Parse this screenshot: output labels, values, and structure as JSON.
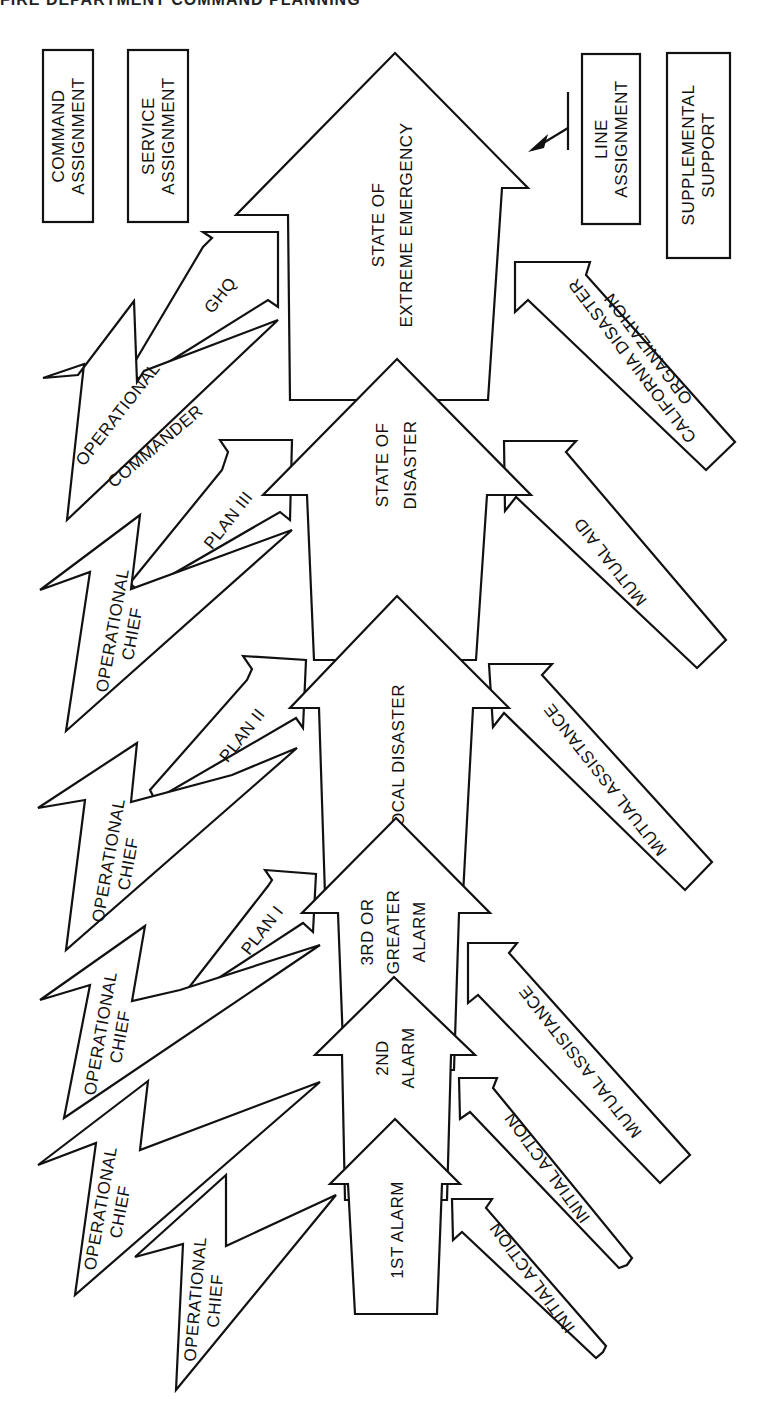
{
  "header": {
    "text": "FIRE DEPARTMENT COMMAND PLANNING"
  },
  "legend": {
    "command": {
      "line1": "COMMAND",
      "line2": "ASSIGNMENT"
    },
    "service": {
      "line1": "SERVICE",
      "line2": "ASSIGNMENT"
    },
    "line": {
      "line1": "LINE",
      "line2": "ASSIGNMENT"
    },
    "supplemental": {
      "line1": "SUPPLEMENTAL",
      "line2": "SUPPORT"
    }
  },
  "levels": [
    {
      "line1": "1ST ALARM",
      "line2": ""
    },
    {
      "line1": "2ND",
      "line2": "ALARM"
    },
    {
      "line1": "3RD OR",
      "line2": "GREATER",
      "line3": "ALARM"
    },
    {
      "line1": "LOCAL DISASTER",
      "line2": ""
    },
    {
      "line1": "STATE OF",
      "line2": "DISASTER"
    },
    {
      "line1": "STATE OF",
      "line2": "EXTREME EMERGENCY"
    }
  ],
  "command_bolts": [
    {
      "line1": "OPERATIONAL",
      "line2": "CHIEF"
    },
    {
      "line1": "OPERATIONAL",
      "line2": "CHIEF"
    },
    {
      "line1": "OPERATIONAL",
      "line2": "CHIEF"
    },
    {
      "line1": "OPERATIONAL",
      "line2": "CHIEF"
    },
    {
      "line1": "OPERATIONAL",
      "line2": "CHIEF"
    },
    {
      "line1": "OPERATIONAL",
      "line2": "COMMANDER"
    }
  ],
  "service_arrows": [
    {
      "label": "PLAN I"
    },
    {
      "label": "PLAN II"
    },
    {
      "label": "PLAN III"
    },
    {
      "label": "GHQ"
    }
  ],
  "support_arrows": [
    {
      "line1": "INITIAL ACTION",
      "line2": ""
    },
    {
      "line1": "INITIAL ACTION",
      "line2": ""
    },
    {
      "line1": "MUTUAL ASSISTANCE",
      "line2": ""
    },
    {
      "line1": "MUTUAL ASSISTANCE",
      "line2": ""
    },
    {
      "line1": "MUTUAL AID",
      "line2": ""
    },
    {
      "line1": "CALIFORNIA DISASTER",
      "line2": "ORGANIZATION"
    }
  ],
  "colors": {
    "stroke": "#111111",
    "fill": "#ffffff",
    "background": "#ffffff"
  }
}
